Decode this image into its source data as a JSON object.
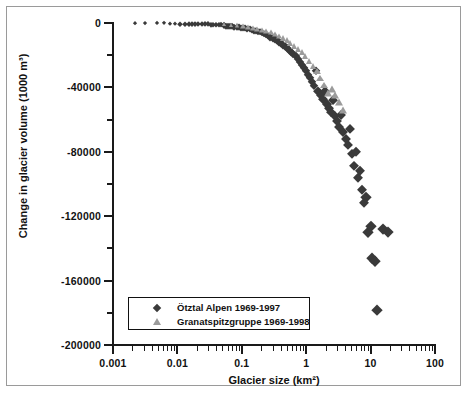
{
  "chart_data": {
    "type": "scatter",
    "title": "",
    "xlabel": "Glacier size (km²)",
    "ylabel": "Change in glacier volume (1000 m³)",
    "xscale": "log",
    "yscale": "linear",
    "xlim": [
      0.001,
      100
    ],
    "ylim": [
      -200000,
      0
    ],
    "xticks": [
      "0.001",
      "0.01",
      "0.1",
      "1",
      "10",
      "100"
    ],
    "yticks": [
      "0",
      "-40000",
      "-80000",
      "-120000",
      "-160000",
      "-200000"
    ],
    "yticks_minor": [
      "-20000",
      "-60000",
      "-100000",
      "-140000",
      "-180000"
    ],
    "grid": false,
    "legend_position": "bottom-left",
    "legend": [
      {
        "label": "Ötztal Alpen 1969-1997",
        "marker": "diamond",
        "color": "#3a3a3a"
      },
      {
        "label": "Granatspitzgruppe 1969-1998",
        "marker": "triangle",
        "color": "#9b9b9b"
      }
    ],
    "series": [
      {
        "name": "Ötztal Alpen 1969-1997",
        "marker": "diamond",
        "color": "#3a3a3a",
        "points": [
          [
            0.0022,
            -120
          ],
          [
            0.0031,
            -160
          ],
          [
            0.0048,
            -260
          ],
          [
            0.0062,
            -300
          ],
          [
            0.0078,
            -340
          ],
          [
            0.0091,
            -380
          ],
          [
            0.011,
            -420
          ],
          [
            0.013,
            -500
          ],
          [
            0.015,
            -560
          ],
          [
            0.017,
            -620
          ],
          [
            0.019,
            -680
          ],
          [
            0.021,
            -700
          ],
          [
            0.024,
            -760
          ],
          [
            0.027,
            -820
          ],
          [
            0.03,
            -900
          ],
          [
            0.033,
            -1000
          ],
          [
            0.036,
            -1100
          ],
          [
            0.04,
            -1200
          ],
          [
            0.044,
            -1300
          ],
          [
            0.048,
            -1400
          ],
          [
            0.052,
            -1500
          ],
          [
            0.056,
            -1650
          ],
          [
            0.061,
            -1800
          ],
          [
            0.066,
            -1950
          ],
          [
            0.071,
            -2100
          ],
          [
            0.077,
            -2300
          ],
          [
            0.083,
            -2500
          ],
          [
            0.09,
            -2700
          ],
          [
            0.097,
            -2900
          ],
          [
            0.105,
            -3100
          ],
          [
            0.113,
            -3400
          ],
          [
            0.122,
            -3700
          ],
          [
            0.132,
            -4000
          ],
          [
            0.142,
            -4300
          ],
          [
            0.153,
            -4700
          ],
          [
            0.165,
            -5100
          ],
          [
            0.178,
            -5500
          ],
          [
            0.192,
            -5900
          ],
          [
            0.207,
            -6400
          ],
          [
            0.223,
            -6900
          ],
          [
            0.24,
            -7400
          ],
          [
            0.259,
            -8000
          ],
          [
            0.279,
            -8600
          ],
          [
            0.301,
            -9300
          ],
          [
            0.324,
            -10000
          ],
          [
            0.349,
            -10800
          ],
          [
            0.376,
            -11600
          ],
          [
            0.405,
            -12500
          ],
          [
            0.437,
            -13400
          ],
          [
            0.471,
            -14400
          ],
          [
            0.507,
            -15500
          ],
          [
            0.546,
            -16700
          ],
          [
            0.589,
            -18000
          ],
          [
            0.634,
            -19300
          ],
          [
            0.683,
            -20800
          ],
          [
            0.736,
            -22300
          ],
          [
            0.793,
            -24000
          ],
          [
            0.854,
            -25800
          ],
          [
            0.92,
            -27700
          ],
          [
            0.991,
            -29800
          ],
          [
            1.07,
            -32000
          ],
          [
            1.15,
            -34000
          ],
          [
            1.24,
            -36500
          ],
          [
            1.34,
            -39000
          ],
          [
            1.44,
            -30000
          ],
          [
            1.55,
            -42000
          ],
          [
            1.67,
            -44500
          ],
          [
            1.8,
            -47000
          ],
          [
            1.94,
            -42500
          ],
          [
            2.09,
            -50000
          ],
          [
            2.25,
            -52500
          ],
          [
            2.42,
            -55000
          ],
          [
            2.61,
            -48000
          ],
          [
            2.81,
            -58000
          ],
          [
            3.03,
            -61000
          ],
          [
            3.26,
            -64500
          ],
          [
            3.52,
            -57000
          ],
          [
            3.79,
            -68000
          ],
          [
            4.08,
            -72000
          ],
          [
            4.4,
            -76000
          ],
          [
            4.74,
            -66000
          ],
          [
            5.1,
            -81500
          ],
          [
            5.5,
            -89000
          ],
          [
            5.92,
            -80000
          ],
          [
            6.38,
            -96000
          ],
          [
            6.87,
            -92000
          ],
          [
            7.4,
            -104000
          ],
          [
            7.97,
            -112000
          ],
          [
            8.59,
            -108000
          ],
          [
            9.25,
            -130000
          ],
          [
            9.97,
            -126000
          ],
          [
            10.7,
            -146000
          ],
          [
            11.6,
            -148000
          ],
          [
            12.5,
            -178000
          ],
          [
            15.8,
            -128000
          ],
          [
            18.5,
            -130000
          ]
        ]
      },
      {
        "name": "Granatspitzgruppe 1969-1998",
        "marker": "triangle",
        "color": "#9b9b9b",
        "points": [
          [
            0.052,
            -900
          ],
          [
            0.068,
            -1200
          ],
          [
            0.085,
            -1500
          ],
          [
            0.103,
            -1900
          ],
          [
            0.125,
            -2400
          ],
          [
            0.148,
            -2900
          ],
          [
            0.175,
            -3500
          ],
          [
            0.205,
            -4200
          ],
          [
            0.24,
            -5000
          ],
          [
            0.28,
            -5900
          ],
          [
            0.325,
            -6900
          ],
          [
            0.375,
            -8000
          ],
          [
            0.43,
            -9200
          ],
          [
            0.495,
            -10600
          ],
          [
            0.57,
            -12200
          ],
          [
            0.65,
            -14000
          ],
          [
            0.745,
            -16000
          ],
          [
            0.85,
            -18200
          ],
          [
            0.97,
            -20600
          ],
          [
            1.11,
            -23400
          ],
          [
            1.27,
            -26500
          ],
          [
            1.45,
            -30000
          ],
          [
            1.66,
            -34000
          ],
          [
            1.9,
            -38500
          ],
          [
            2.17,
            -43500
          ],
          [
            2.48,
            -41000
          ],
          [
            2.84,
            -45000
          ],
          [
            3.25,
            -49000
          ],
          [
            3.72,
            -54000
          ]
        ]
      }
    ]
  },
  "axes": {
    "x_title": "Glacier size (km²)",
    "y_title": "Change in glacier volume (1000 m³)"
  },
  "legend": {
    "entries": [
      {
        "label": "Ötztal Alpen 1969-1997"
      },
      {
        "label": "Granatspitzgruppe 1969-1998"
      }
    ]
  },
  "colors": {
    "series_1": "#3a3a3a",
    "series_2": "#9b9b9b",
    "axis": "#1a1a1a",
    "frame": "#9a9a9a"
  }
}
